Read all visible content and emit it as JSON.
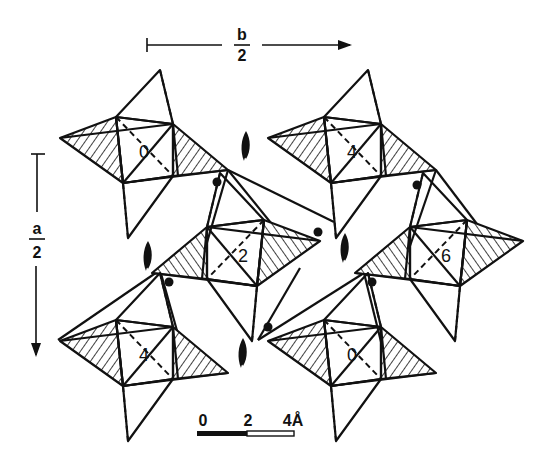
{
  "diagram": {
    "type": "crystal-structure-projection",
    "axes": {
      "b": {
        "numerator": "b",
        "denominator": "2",
        "direction": "right"
      },
      "a": {
        "numerator": "a",
        "denominator": "2",
        "direction": "down"
      }
    },
    "scale_bar": {
      "labels": [
        "0",
        "2",
        "4Å"
      ],
      "unit": "Å"
    },
    "clusters": [
      {
        "label": "0",
        "cx": 137,
        "cy": 152
      },
      {
        "label": "4",
        "cx": 345,
        "cy": 152
      },
      {
        "label": "2",
        "cx": 243,
        "cy": 255
      },
      {
        "label": "6",
        "cx": 446,
        "cy": 255
      },
      {
        "label": "4",
        "cx": 137,
        "cy": 355
      },
      {
        "label": "0",
        "cx": 345,
        "cy": 355
      }
    ],
    "screw_axes": [
      {
        "x": 246,
        "y": 145
      },
      {
        "x": 148,
        "y": 255
      },
      {
        "x": 345,
        "y": 247
      },
      {
        "x": 243,
        "y": 352
      }
    ],
    "dots": [
      {
        "x": 217,
        "y": 182
      },
      {
        "x": 417,
        "y": 185
      },
      {
        "x": 318,
        "y": 232
      },
      {
        "x": 169,
        "y": 282
      },
      {
        "x": 372,
        "y": 282
      },
      {
        "x": 268,
        "y": 327
      }
    ]
  }
}
